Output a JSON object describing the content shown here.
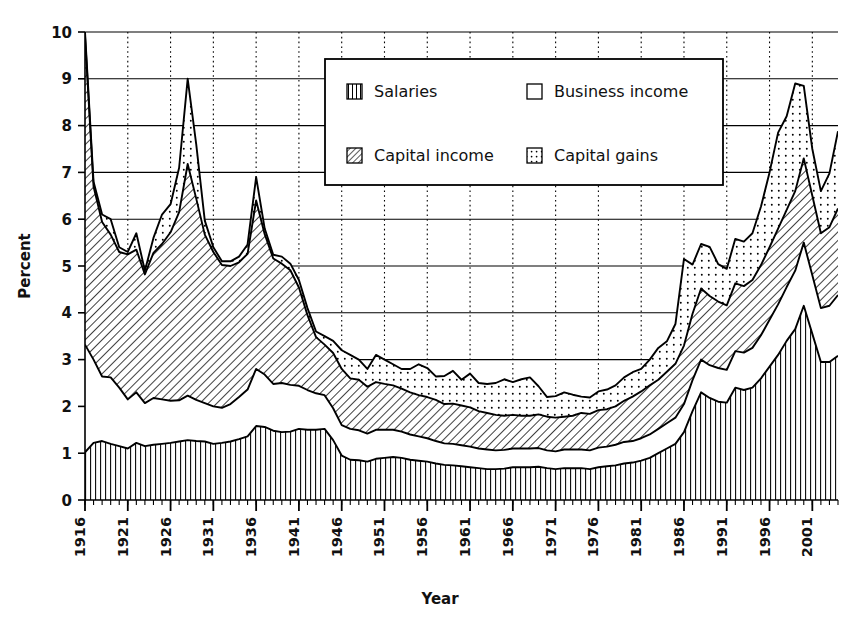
{
  "chart_data": {
    "type": "area",
    "stacked": true,
    "title": "",
    "xlabel": "Year",
    "ylabel": "Percent",
    "xlim": [
      1916,
      2004
    ],
    "ylim": [
      0,
      10
    ],
    "y_ticks": [
      0,
      1,
      2,
      3,
      4,
      5,
      6,
      7,
      8,
      9,
      10
    ],
    "y_tick_labels": [
      "0",
      "1",
      "2",
      "3",
      "4",
      "5",
      "6",
      "7",
      "8",
      "9",
      "10"
    ],
    "x_ticks": [
      1916,
      1921,
      1926,
      1931,
      1936,
      1941,
      1946,
      1951,
      1956,
      1961,
      1966,
      1971,
      1976,
      1981,
      1986,
      1991,
      1996,
      2001
    ],
    "x_tick_labels": [
      "1916",
      "1921",
      "1926",
      "1931",
      "1936",
      "1941",
      "1946",
      "1951",
      "1956",
      "1961",
      "1966",
      "1971",
      "1976",
      "1981",
      "1986",
      "1991",
      "1996",
      "2001"
    ],
    "x_minor_tick_step": 1,
    "grid": {
      "horizontal": true,
      "vertical_dotted": true,
      "vertical_step": 5
    },
    "legend": {
      "position": "top-center-right",
      "entries": [
        {
          "label": "Salaries",
          "pattern": "vertical-lines"
        },
        {
          "label": "Business income",
          "pattern": "blank"
        },
        {
          "label": "Capital income",
          "pattern": "diagonal-hatch"
        },
        {
          "label": "Capital gains",
          "pattern": "dots"
        }
      ]
    },
    "x": [
      1916,
      1917,
      1918,
      1919,
      1920,
      1921,
      1922,
      1923,
      1924,
      1925,
      1926,
      1927,
      1928,
      1929,
      1930,
      1931,
      1932,
      1933,
      1934,
      1935,
      1936,
      1937,
      1938,
      1939,
      1940,
      1941,
      1942,
      1943,
      1944,
      1945,
      1946,
      1947,
      1948,
      1949,
      1950,
      1951,
      1952,
      1953,
      1954,
      1955,
      1956,
      1957,
      1958,
      1959,
      1960,
      1961,
      1962,
      1963,
      1964,
      1965,
      1966,
      1967,
      1968,
      1969,
      1970,
      1971,
      1972,
      1973,
      1974,
      1975,
      1976,
      1977,
      1978,
      1979,
      1980,
      1981,
      1982,
      1983,
      1984,
      1985,
      1986,
      1987,
      1988,
      1989,
      1990,
      1991,
      1992,
      1993,
      1994,
      1995,
      1996,
      1997,
      1998,
      1999,
      2000,
      2001,
      2002,
      2003,
      2004
    ],
    "series": [
      {
        "name": "Salaries",
        "pattern": "vertical-lines",
        "values": [
          1.02,
          1.22,
          1.26,
          1.2,
          1.15,
          1.1,
          1.22,
          1.15,
          1.18,
          1.2,
          1.22,
          1.25,
          1.28,
          1.26,
          1.25,
          1.2,
          1.22,
          1.25,
          1.3,
          1.36,
          1.58,
          1.56,
          1.48,
          1.45,
          1.46,
          1.52,
          1.5,
          1.5,
          1.52,
          1.28,
          0.95,
          0.86,
          0.85,
          0.82,
          0.88,
          0.9,
          0.92,
          0.9,
          0.86,
          0.84,
          0.82,
          0.78,
          0.75,
          0.74,
          0.72,
          0.7,
          0.68,
          0.66,
          0.66,
          0.67,
          0.7,
          0.7,
          0.7,
          0.71,
          0.68,
          0.66,
          0.68,
          0.68,
          0.68,
          0.66,
          0.7,
          0.72,
          0.74,
          0.78,
          0.8,
          0.84,
          0.9,
          1.0,
          1.1,
          1.2,
          1.45,
          1.9,
          2.3,
          2.18,
          2.1,
          2.08,
          2.4,
          2.35,
          2.4,
          2.6,
          2.85,
          3.1,
          3.4,
          3.65,
          4.15,
          3.55,
          2.95,
          2.95,
          3.08
        ]
      },
      {
        "name": "Business income",
        "pattern": "blank",
        "values": [
          2.3,
          1.78,
          1.38,
          1.42,
          1.25,
          1.05,
          1.08,
          0.92,
          1.0,
          0.95,
          0.9,
          0.88,
          0.95,
          0.88,
          0.82,
          0.8,
          0.75,
          0.8,
          0.9,
          1.0,
          1.22,
          1.12,
          1.0,
          1.05,
          1.0,
          0.92,
          0.85,
          0.78,
          0.72,
          0.68,
          0.65,
          0.66,
          0.64,
          0.6,
          0.62,
          0.6,
          0.58,
          0.56,
          0.54,
          0.52,
          0.5,
          0.48,
          0.46,
          0.46,
          0.45,
          0.44,
          0.42,
          0.42,
          0.4,
          0.4,
          0.4,
          0.4,
          0.4,
          0.4,
          0.38,
          0.38,
          0.4,
          0.4,
          0.4,
          0.4,
          0.42,
          0.42,
          0.44,
          0.46,
          0.46,
          0.48,
          0.5,
          0.52,
          0.54,
          0.56,
          0.6,
          0.66,
          0.7,
          0.7,
          0.72,
          0.7,
          0.78,
          0.8,
          0.85,
          0.92,
          1.0,
          1.08,
          1.15,
          1.25,
          1.35,
          1.25,
          1.15,
          1.2,
          1.3
        ]
      },
      {
        "name": "Capital income",
        "pattern": "diagonal-hatch",
        "values": [
          6.6,
          3.7,
          3.3,
          3.05,
          2.9,
          3.1,
          3.05,
          2.75,
          3.1,
          3.32,
          3.6,
          4.02,
          4.95,
          4.3,
          3.6,
          3.3,
          3.05,
          2.95,
          2.88,
          2.9,
          3.6,
          3.0,
          2.68,
          2.55,
          2.45,
          2.1,
          1.6,
          1.2,
          1.08,
          1.18,
          1.2,
          1.08,
          1.08,
          1.0,
          1.02,
          0.98,
          0.95,
          0.92,
          0.9,
          0.88,
          0.88,
          0.88,
          0.84,
          0.86,
          0.85,
          0.84,
          0.8,
          0.78,
          0.76,
          0.73,
          0.72,
          0.7,
          0.7,
          0.72,
          0.72,
          0.72,
          0.7,
          0.72,
          0.78,
          0.78,
          0.8,
          0.8,
          0.82,
          0.88,
          0.95,
          1.0,
          1.05,
          1.05,
          1.1,
          1.15,
          1.25,
          1.42,
          1.52,
          1.48,
          1.42,
          1.38,
          1.45,
          1.42,
          1.45,
          1.5,
          1.55,
          1.62,
          1.65,
          1.7,
          1.8,
          1.7,
          1.6,
          1.68,
          1.85
        ]
      },
      {
        "name": "Capital gains",
        "pattern": "dots",
        "values": [
          0.08,
          0.1,
          0.16,
          0.33,
          0.1,
          0.05,
          0.35,
          0.08,
          0.32,
          0.63,
          0.6,
          0.95,
          1.82,
          1.16,
          0.3,
          0.1,
          0.08,
          0.1,
          0.12,
          0.2,
          0.5,
          0.12,
          0.08,
          0.15,
          0.14,
          0.16,
          0.15,
          0.12,
          0.18,
          0.26,
          0.4,
          0.5,
          0.43,
          0.38,
          0.58,
          0.52,
          0.45,
          0.42,
          0.5,
          0.66,
          0.62,
          0.5,
          0.6,
          0.7,
          0.55,
          0.72,
          0.6,
          0.62,
          0.68,
          0.78,
          0.7,
          0.78,
          0.82,
          0.6,
          0.42,
          0.46,
          0.52,
          0.45,
          0.35,
          0.35,
          0.4,
          0.42,
          0.45,
          0.5,
          0.52,
          0.48,
          0.55,
          0.68,
          0.65,
          0.85,
          1.85,
          1.05,
          0.95,
          1.05,
          0.8,
          0.78,
          0.95,
          0.95,
          1.0,
          1.25,
          1.6,
          2.05,
          2.0,
          2.3,
          1.55,
          1.0,
          0.9,
          1.15,
          1.65
        ]
      }
    ]
  },
  "axes": {
    "ylabel": "Percent",
    "xlabel": "Year"
  }
}
